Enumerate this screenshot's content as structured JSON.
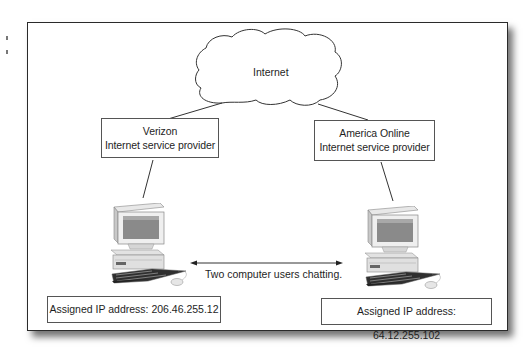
{
  "diagram": {
    "title": "",
    "cloud": {
      "label": "Internet",
      "icon": "cloud-icon"
    },
    "providers": [
      {
        "name": "Verizon",
        "subtitle": "Internet service provider"
      },
      {
        "name": "America Online",
        "subtitle": "Internet service provider"
      }
    ],
    "computers": [
      {
        "icon": "desktop-computer-icon",
        "ip_label": "Assigned IP address: 206.46.255.12"
      },
      {
        "icon": "desktop-computer-icon",
        "ip_label": "Assigned IP address: 64.12.255.102"
      }
    ],
    "chat_arrow": {
      "label": "Two computer users chatting.",
      "direction": "bidirectional"
    },
    "colors": {
      "line": "#333333",
      "background": "#ffffff",
      "border": "#2a2a2a"
    }
  }
}
